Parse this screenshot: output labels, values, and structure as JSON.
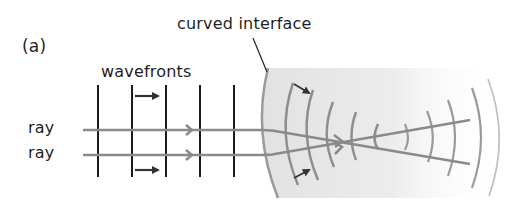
{
  "figure": {
    "panel_label": "(a)",
    "labels": {
      "interface": "curved interface",
      "wavefronts": "wavefronts",
      "ray_top": "ray",
      "ray_bottom": "ray"
    },
    "colors": {
      "text": "#1f1f1f",
      "wavefront_plane": "#1a1a1a",
      "ray": "#8a8a8a",
      "wavefront_curved": "#8e8e8e",
      "medium_fill": "#e6e6e6",
      "direction_arrow": "#333333"
    },
    "plane_wavefront_x": [
      98,
      132,
      166,
      200,
      234
    ],
    "ray_y": [
      130,
      155
    ]
  }
}
